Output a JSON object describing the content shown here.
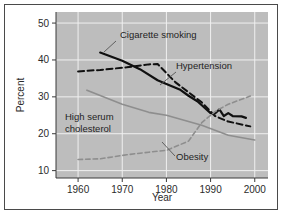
{
  "chart_data": {
    "type": "line",
    "title": "",
    "xlabel": "Year",
    "ylabel": "Percent",
    "xlim": [
      1955,
      2003
    ],
    "ylim": [
      8,
      53
    ],
    "xticks": [
      1960,
      1970,
      1980,
      1990,
      2000
    ],
    "yticks": [
      10,
      20,
      30,
      40,
      50
    ],
    "grid": true,
    "grid_color": "#f0f0f0",
    "plot_background": "#bdbdbd",
    "legend_position": "inline-annotations",
    "series": [
      {
        "name": "Cigarette smoking",
        "label": "Cigarette smoking",
        "style": "solid",
        "color": "#101010",
        "width": 2.2,
        "points": [
          [
            1965,
            42.0
          ],
          [
            1970,
            39.8
          ],
          [
            1974,
            37.5
          ],
          [
            1978,
            34.5
          ],
          [
            1980,
            33.5
          ],
          [
            1983,
            32.0
          ],
          [
            1985,
            30.3
          ],
          [
            1987,
            28.8
          ],
          [
            1990,
            25.6
          ],
          [
            1991,
            25.5
          ],
          [
            1992,
            26.6
          ],
          [
            1993,
            24.8
          ],
          [
            1994,
            25.6
          ],
          [
            1995,
            24.8
          ],
          [
            1997,
            24.7
          ],
          [
            1998,
            24.3
          ]
        ]
      },
      {
        "name": "Hypertension",
        "label": "Hypertension",
        "style": "dashed",
        "color": "#101010",
        "width": 2.0,
        "points": [
          [
            1960,
            36.9
          ],
          [
            1965,
            37.3
          ],
          [
            1971,
            38.0
          ],
          [
            1976,
            38.8
          ],
          [
            1978,
            38.9
          ],
          [
            1982,
            34.0
          ],
          [
            1988,
            28.5
          ],
          [
            1991,
            24.8
          ],
          [
            1994,
            23.3
          ],
          [
            1999,
            22.0
          ]
        ]
      },
      {
        "name": "High serum cholesterol",
        "label": "High serum cholesterol",
        "style": "solid",
        "color": "#8e8e8e",
        "width": 1.6,
        "points": [
          [
            1962,
            31.8
          ],
          [
            1970,
            28.0
          ],
          [
            1976,
            25.8
          ],
          [
            1980,
            25.0
          ],
          [
            1988,
            22.3
          ],
          [
            1994,
            19.6
          ],
          [
            2000,
            18.3
          ]
        ]
      },
      {
        "name": "Obesity",
        "label": "Obesity",
        "style": "dashed",
        "color": "#8e8e8e",
        "width": 1.6,
        "points": [
          [
            1960,
            13.0
          ],
          [
            1965,
            13.2
          ],
          [
            1971,
            14.3
          ],
          [
            1976,
            15.0
          ],
          [
            1980,
            15.5
          ],
          [
            1985,
            18.0
          ],
          [
            1988,
            23.0
          ],
          [
            1991,
            26.0
          ],
          [
            1994,
            28.0
          ],
          [
            1999,
            30.2
          ]
        ]
      }
    ],
    "annotations": [
      {
        "text": "Cigarette smoking",
        "text_x": 120,
        "text_y": 38,
        "anchor": "start",
        "leader": [
          116,
          41,
          104,
          52
        ]
      },
      {
        "text": "Hypertension",
        "text_x": 176,
        "text_y": 69,
        "anchor": "start",
        "leader": [
          176,
          72,
          160,
          85
        ]
      },
      {
        "text": "High serum",
        "text_x": 65,
        "text_y": 120,
        "anchor": "start",
        "leader": null
      },
      {
        "text": "cholesterol",
        "text_x": 65,
        "text_y": 132,
        "anchor": "start",
        "leader": null
      },
      {
        "text": "Obesity",
        "text_x": 176,
        "text_y": 160,
        "anchor": "start",
        "leader": [
          175,
          156,
          162,
          142
        ]
      }
    ]
  },
  "axes": {
    "y_label": "Percent",
    "x_label": "Year",
    "y_tick_labels": [
      "50",
      "40",
      "30",
      "20",
      "10"
    ],
    "x_tick_labels": [
      "1960",
      "1970",
      "1980",
      "1990",
      "2000"
    ]
  }
}
